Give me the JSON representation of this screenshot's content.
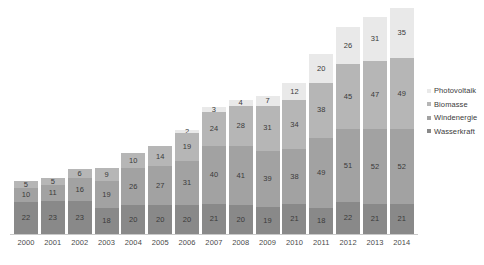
{
  "chart_data": {
    "type": "bar",
    "subtype": "stacked-bar",
    "title": "",
    "subtitle": "",
    "xlabel": "",
    "ylabel": "",
    "grid": false,
    "legend_position": "right",
    "ylim": [
      0,
      157
    ],
    "categories": [
      "2000",
      "2001",
      "2002",
      "2003",
      "2004",
      "2005",
      "2006",
      "2007",
      "2008",
      "2009",
      "2010",
      "2011",
      "2012",
      "2013",
      "2014"
    ],
    "series": [
      {
        "name": "Wasserkraft",
        "key": "wasser",
        "color": "#898989",
        "values": [
          22,
          23,
          23,
          18,
          20,
          20,
          20,
          21,
          20,
          19,
          21,
          18,
          22,
          21,
          21
        ]
      },
      {
        "name": "Windenergie",
        "key": "wind",
        "color": "#a2a2a2",
        "values": [
          10,
          11,
          16,
          19,
          26,
          27,
          31,
          40,
          41,
          39,
          38,
          49,
          51,
          52,
          52
        ]
      },
      {
        "name": "Biomasse",
        "key": "bio",
        "color": "#b6b6b6",
        "values": [
          5,
          5,
          6,
          9,
          10,
          14,
          19,
          24,
          28,
          31,
          34,
          38,
          45,
          47,
          49
        ]
      },
      {
        "name": "Photovoltaik",
        "key": "pv",
        "color": "#e9e9e9",
        "values": [
          null,
          null,
          null,
          null,
          null,
          null,
          2,
          3,
          4,
          7,
          12,
          20,
          26,
          31,
          35
        ]
      }
    ],
    "legend": [
      {
        "label": "Photovoltaik",
        "key": "pv",
        "color": "#e9e9e9"
      },
      {
        "label": "Biomasse",
        "key": "bio",
        "color": "#b6b6b6"
      },
      {
        "label": "Windenergie",
        "key": "wind",
        "color": "#a2a2a2"
      },
      {
        "label": "Wasserkraft",
        "key": "wasser",
        "color": "#898989"
      }
    ],
    "totals": [
      37,
      39,
      45,
      46,
      56,
      61,
      72,
      88,
      93,
      96,
      105,
      125,
      144,
      151,
      157
    ]
  }
}
